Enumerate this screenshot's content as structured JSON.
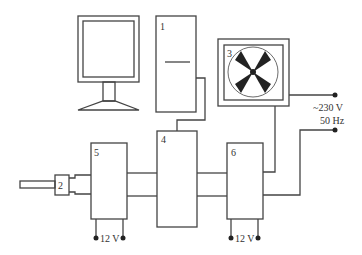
{
  "diagram": {
    "title": "",
    "components": [
      {
        "id": "monitor",
        "label": ""
      },
      {
        "id": "1",
        "label": "1"
      },
      {
        "id": "2",
        "label": "2"
      },
      {
        "id": "3",
        "label": "3"
      },
      {
        "id": "4",
        "label": "4"
      },
      {
        "id": "5",
        "label": "5"
      },
      {
        "id": "6",
        "label": "6"
      }
    ],
    "power": {
      "mains_voltage": "~230 V",
      "mains_freq": "50 Hz",
      "dc_5": "12 V",
      "dc_6": "12 V"
    },
    "colors": {
      "line": "#444444",
      "fill": "#222222"
    }
  }
}
